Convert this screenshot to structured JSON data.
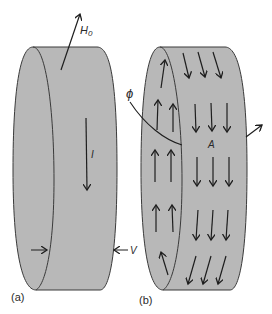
{
  "figure": {
    "panel_a": {
      "label": "(a)",
      "field_label": "H",
      "field_subscript": "0",
      "current_label": "I",
      "thickness_label": "V"
    },
    "panel_b": {
      "label": "(b)",
      "flux_label": "ϕ",
      "area_label": "A"
    },
    "colors": {
      "cylinder_fill": "#b8b8b8",
      "outline": "#3a3a3a",
      "arrow": "#1e1e1e",
      "background": "#ffffff"
    }
  }
}
